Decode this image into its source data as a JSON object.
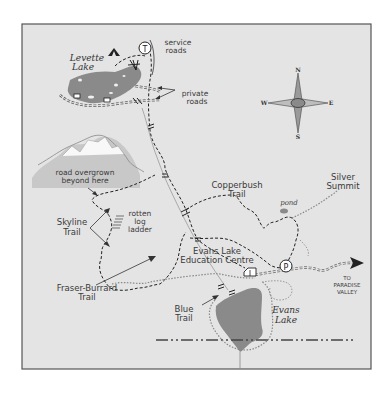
{
  "map": {
    "background_color": "#e4e4e4",
    "lake_color": "#8a8a8a",
    "frame_color": "#555555",
    "labels": {
      "levette_lake_1": "Levette",
      "levette_lake_2": "Lake",
      "service_roads_1": "service",
      "service_roads_2": "roads",
      "private_roads_1": "private",
      "private_roads_2": "roads",
      "road_overgrown_1": "road overgrown",
      "road_overgrown_2": "beyond here",
      "skyline_trail_1": "Skyline",
      "skyline_trail_2": "Trail",
      "rotten_log_ladder_1": "rotten",
      "rotten_log_ladder_2": "log",
      "rotten_log_ladder_3": "ladder",
      "copperbush_trail_1": "Copperbush",
      "copperbush_trail_2": "Trail",
      "silver_summit_1": "Silver",
      "silver_summit_2": "Summit",
      "pond": "pond",
      "evans_lake_centre_1": "Evans Lake",
      "evans_lake_centre_2": "Education Centre",
      "fraser_burrard_trail_1": "Fraser-Burrard",
      "fraser_burrard_trail_2": "Trail",
      "blue_trail_1": "Blue",
      "blue_trail_2": "Trail",
      "evans_lake_1": "Evans",
      "evans_lake_2": "Lake",
      "to_paradise_valley_1": "TO",
      "to_paradise_valley_2": "PARADISE",
      "to_paradise_valley_3": "VALLEY"
    },
    "compass": {
      "north": "N",
      "south": "S",
      "east": "E",
      "west": "W"
    },
    "icons": {
      "telephone": "T",
      "parking": "P",
      "campground": "tent-icon",
      "picnic": "picnic-icon",
      "cabin": "cabin-icon"
    }
  }
}
